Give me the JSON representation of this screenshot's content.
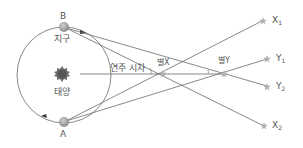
{
  "diagram": {
    "title": "",
    "colors": {
      "line": "#6b6b6b",
      "planet": "#9a9a9a",
      "sun": "#6e6e6e",
      "star": "#b0b0b0",
      "text": "#555555"
    },
    "labels": {
      "point_b": "B",
      "point_a": "A",
      "earth": "지구",
      "sun": "태양",
      "parallax": "연주 시차",
      "star_x": "별X",
      "star_y": "별Y",
      "x1_main": "X",
      "x1_sub": "1",
      "y1_main": "Y",
      "y1_sub": "1",
      "y2_main": "Y",
      "y2_sub": "2",
      "x2_main": "X",
      "x2_sub": "2"
    },
    "nodes": {
      "sun": {
        "x": 62,
        "y": 74
      },
      "earth_b": {
        "x": 64,
        "y": 27
      },
      "earth_a": {
        "x": 64,
        "y": 122
      },
      "star_x": {
        "x": 163,
        "y": 74
      },
      "star_y": {
        "x": 224,
        "y": 74
      },
      "far_x1": {
        "x": 262,
        "y": 21
      },
      "far_y1": {
        "x": 267,
        "y": 59
      },
      "far_y2": {
        "x": 267,
        "y": 86
      },
      "far_x2": {
        "x": 264,
        "y": 126
      }
    }
  }
}
